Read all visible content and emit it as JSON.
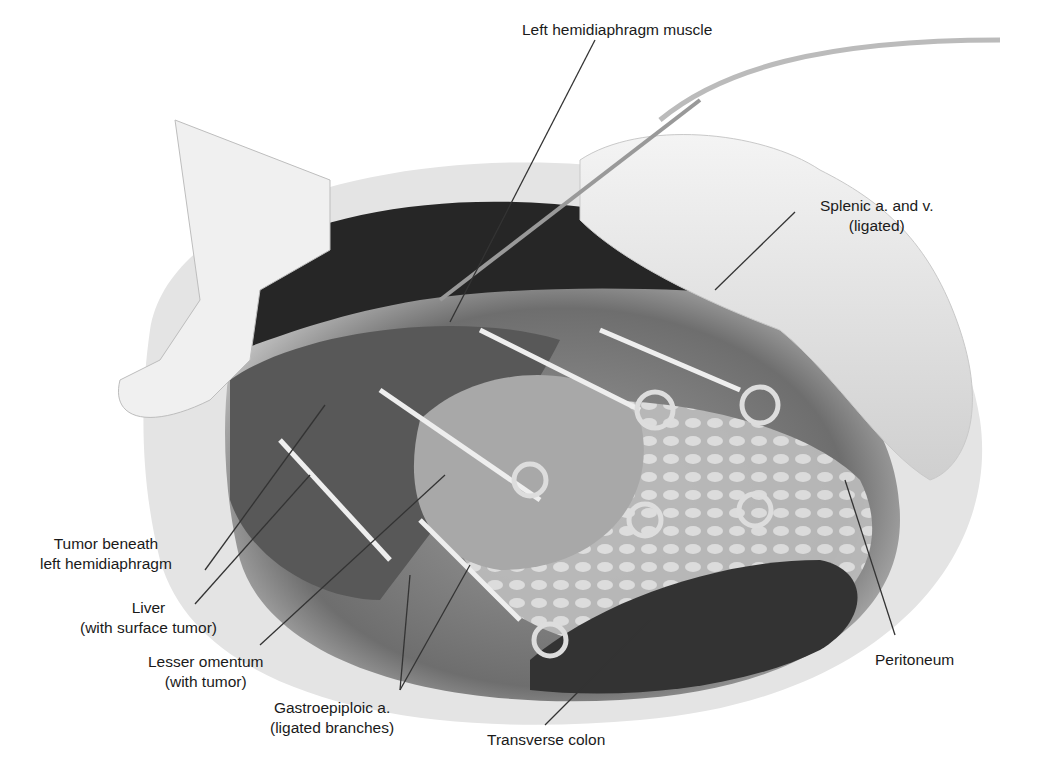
{
  "figure": {
    "type": "surgical anatomical illustration",
    "view": "open abdomen, left upper quadrant",
    "colors": {
      "background": "#ffffff",
      "ink": "#1a1a1a",
      "tissue_dark": "#2a2a2a",
      "tissue_mid": "#7d7d7d",
      "tissue_light": "#d9d9d9",
      "leader_line": "#333333"
    }
  },
  "labels": [
    {
      "id": "left-hemidiaphragm-muscle",
      "line1": "Left hemidiaphragm muscle",
      "line2": ""
    },
    {
      "id": "splenic-vessels",
      "line1": "Splenic a. and v.",
      "line2": "(ligated)"
    },
    {
      "id": "tumor-beneath-diaphragm",
      "line1": "Tumor beneath",
      "line2": "left hemidiaphragm"
    },
    {
      "id": "liver",
      "line1": "Liver",
      "line2": "(with surface tumor)"
    },
    {
      "id": "lesser-omentum",
      "line1": "Lesser omentum",
      "line2": "(with tumor)"
    },
    {
      "id": "gastroepiploic",
      "line1": "Gastroepiploic a.",
      "line2": "(ligated branches)"
    },
    {
      "id": "transverse-colon",
      "line1": "Transverse colon",
      "line2": ""
    },
    {
      "id": "peritoneum",
      "line1": "Peritoneum",
      "line2": ""
    }
  ]
}
